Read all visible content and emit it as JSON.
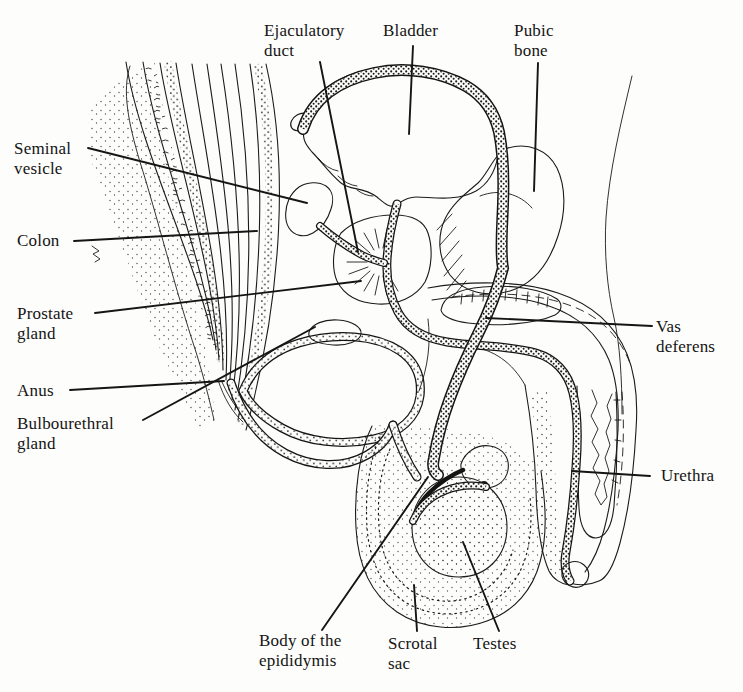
{
  "labels": {
    "ejaculatory_duct": "Ejaculatory duct",
    "bladder": "Bladder",
    "pubic_bone": "Pubic bone",
    "seminal_vesicle": "Seminal vesicle",
    "colon": "Colon",
    "prostate_gland": "Prostate gland",
    "anus": "Anus",
    "bulbourethral_gland": "Bulbourethral gland",
    "vas_deferens": "Vas deferens",
    "urethra": "Urethra",
    "body_of_the_epididymis": "Body of the epididymis",
    "scrotal_sac": "Scrotal sac",
    "testes": "Testes"
  },
  "colors": {
    "ink": "#1b1b1b",
    "paper": "#fdfdfb"
  }
}
